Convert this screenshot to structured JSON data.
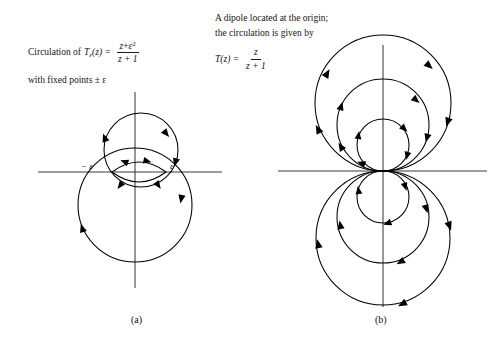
{
  "figure": {
    "background_color": "#ffffff",
    "ink_color": "#000000",
    "axis_color": "#3a3a3a"
  },
  "panel_a": {
    "label": "(a)",
    "caption": {
      "line1_prefix": "Circulation of",
      "function_name": "T",
      "function_subscript": "ε",
      "function_arg": "(z) =",
      "numerator_var": "z",
      "numerator_plus": "+",
      "numerator_eps": "ε",
      "numerator_eps_exponent": "2",
      "denominator": "z + 1",
      "line2": "with fixed points ± ε"
    },
    "axis_labels": {
      "left_fixed_point": "− ε",
      "right_fixed_point": "ε"
    },
    "geometry": {
      "origin_x": 135,
      "origin_y": 172,
      "h_axis_x1": 38,
      "h_axis_x2": 222,
      "v_axis_y1": 92,
      "v_axis_y2": 288,
      "fixed_point_left_x": 112,
      "fixed_point_right_x": 166,
      "upper_circle": {
        "cx": 141,
        "cy": 150,
        "r": 37
      },
      "lens_half_height": 16,
      "lower_circle": {
        "cx": 135,
        "cy": 205,
        "r": 57
      }
    }
  },
  "panel_b": {
    "label": "(b)",
    "caption": {
      "line1": "A dipole located at the origin;",
      "line2": "the circulation is given by",
      "function_name": "T",
      "function_arg": "(z) =",
      "numerator": "z",
      "denominator": "z + 1"
    },
    "geometry": {
      "origin_x": 383,
      "origin_y": 171,
      "h_axis_x1": 278,
      "h_axis_x2": 487,
      "v_axis_y1": 45,
      "v_axis_y2": 307,
      "upper_radii": [
        26,
        46,
        68
      ],
      "lower_radii": [
        26,
        46,
        67
      ]
    }
  }
}
